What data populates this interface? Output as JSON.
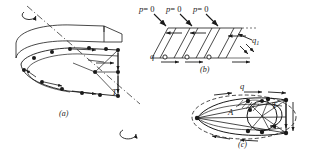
{
  "figure": {
    "background_color": "#ffffff",
    "ink_color": "#1a1a1a",
    "width": 312,
    "height": 156
  },
  "panels": [
    {
      "id": "a",
      "caption": "(a)",
      "description": "Three-dimensional rotating annular blade cascade with vortex lattice points, rotation axis and applied torque",
      "labels": [
        {
          "name": "torque",
          "text": "T"
        }
      ]
    },
    {
      "id": "b",
      "caption": "(b)",
      "description": "Planar unrolled cascade of slanted blades with zero-pressure boundary condition and shed vorticity",
      "labels": [
        {
          "name": "pressure-zero-1",
          "text": "p = 0"
        },
        {
          "name": "pressure-zero-2",
          "text": "p = 0"
        },
        {
          "name": "pressure-zero-3",
          "text": "p = 0"
        },
        {
          "name": "bound-vorticity",
          "text": "q"
        },
        {
          "name": "shed-vorticity",
          "text": "q1"
        }
      ]
    },
    {
      "id": "c",
      "caption": "(c)",
      "description": "Airfoil section transformed to a circle, showing circulation, area A and torque T",
      "labels": [
        {
          "name": "vorticity",
          "text": "q"
        },
        {
          "name": "area",
          "text": "A"
        },
        {
          "name": "torque",
          "text": "T"
        }
      ]
    }
  ],
  "text": {
    "p_eq_0": "p",
    "p_eq_0_rhs": "= 0",
    "q": "q",
    "q1_base": "q",
    "q1_sub": "1",
    "T": "T",
    "A": "A",
    "cap_a": "(a)",
    "cap_b": "(b)",
    "cap_c": "(c)"
  }
}
